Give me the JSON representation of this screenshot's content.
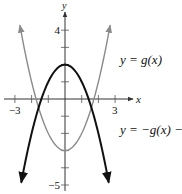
{
  "chart_data": {
    "type": "line",
    "title": "",
    "xlabel": "x",
    "ylabel": "y",
    "xlim": [
      -3,
      3
    ],
    "ylim": [
      -5,
      4
    ],
    "grid": false,
    "x_ticks": [
      -3,
      -2,
      -1,
      1,
      2,
      3
    ],
    "x_tick_labels": [
      {
        "value": -3,
        "label": "−3"
      },
      {
        "value": 3,
        "label": "3"
      }
    ],
    "y_ticks": [
      -5,
      -4,
      -3,
      -2,
      -1,
      1,
      2,
      3,
      4
    ],
    "y_tick_labels": [
      {
        "value": 4,
        "label": "4"
      },
      {
        "value": -5,
        "label": "−5"
      }
    ],
    "series": [
      {
        "name": "y = g(x)",
        "label": "y = g(x)",
        "formula": "x^2 - 3",
        "color": "#8a8a8a",
        "x_range": [
          -2.7,
          2.7
        ],
        "vertex": [
          0,
          -3
        ],
        "arrows": "both-ends"
      },
      {
        "name": "y = −g(x) − 1",
        "label": "y = −g(x) − 1",
        "formula": "-x^2 + 2",
        "color": "#111111",
        "x_range": [
          -2.62,
          2.62
        ],
        "vertex": [
          0,
          2
        ],
        "arrows": "both-ends"
      }
    ],
    "annotations": [
      {
        "text": "y = g(x)",
        "near": "right of upper-right gray branch"
      },
      {
        "text": "y = −g(x) − 1",
        "near": "right side below x-axis"
      }
    ]
  }
}
